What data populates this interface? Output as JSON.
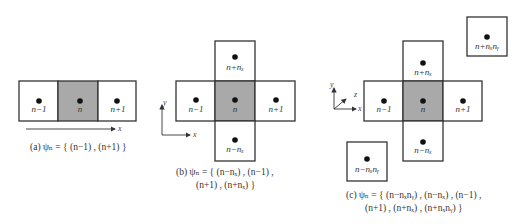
{
  "colors": {
    "center_fill": "#a9a9a9",
    "cell_fill": "#ffffff",
    "stroke": "#333333"
  },
  "panel_a": {
    "cells": [
      {
        "label": "n−1",
        "center": false
      },
      {
        "label": "n",
        "center": true
      },
      {
        "label": "n+1",
        "center": false
      }
    ],
    "axis_x": "x",
    "caption": "(a)   ψₙ = {  (n−1)  ,  (n+1)  }"
  },
  "panel_b": {
    "cells": {
      "top": "n+nₓ",
      "left": "n−1",
      "center": "n",
      "right": "n+1",
      "bottom": "n−nₓ"
    },
    "axis_x": "x",
    "axis_y": "y",
    "caption_line1": "(b)  ψₙ = {  (n−nₓ)  ,  (n−1)  ,",
    "caption_line2": "(n+1)  ,  (n+nₓ)  }"
  },
  "panel_c": {
    "cells": {
      "top": "n+nₓ",
      "left": "n−1",
      "center": "n",
      "right": "n+1",
      "bottom": "n−nₓ",
      "far_top_right": "n+nₓnᵧ",
      "far_bottom_left": "n−nₓnᵧ"
    },
    "axis_x": "x",
    "axis_y": "y",
    "axis_z": "z",
    "caption_line1": "(c)  ψₙ = {  (n−nₓnᵧ)  ,  (n−nₓ)  ,  (n−1)  ,",
    "caption_line2": "(n+1)  ,  (n+nₓ)  ,  (n+nₓnᵧ)  }"
  }
}
